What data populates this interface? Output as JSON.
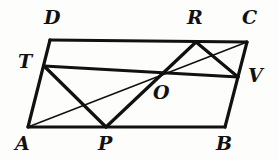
{
  "figure": {
    "background_color": "#fdfdfb",
    "stroke_color": "#111111",
    "thick_stroke_width": 3.2,
    "thin_stroke_width": 1.5,
    "width": 278,
    "height": 161
  },
  "points": {
    "D": {
      "label": "D",
      "x": 50,
      "y": 40,
      "label_x": 44,
      "label_y": 8
    },
    "C": {
      "label": "C",
      "x": 247,
      "y": 42,
      "label_x": 242,
      "label_y": 8
    },
    "A": {
      "label": "A",
      "x": 28,
      "y": 127,
      "label_x": 15,
      "label_y": 134
    },
    "B": {
      "label": "B",
      "x": 225,
      "y": 127,
      "label_x": 216,
      "label_y": 134
    },
    "T": {
      "label": "T",
      "x": 44,
      "y": 66,
      "label_x": 18,
      "label_y": 52
    },
    "R": {
      "label": "R",
      "x": 196,
      "y": 42,
      "label_x": 187,
      "label_y": 8
    },
    "V": {
      "label": "V",
      "x": 238,
      "y": 77,
      "label_x": 248,
      "label_y": 66
    },
    "P": {
      "label": "P",
      "x": 106,
      "y": 127,
      "label_x": 98,
      "label_y": 134
    },
    "O": {
      "label": "O",
      "x": 157,
      "y": 76,
      "label_x": 153,
      "label_y": 83
    }
  },
  "segments": [
    {
      "name": "side-DC",
      "from": "D",
      "to": "C",
      "weight": "thick"
    },
    {
      "name": "side-CB",
      "from": "C",
      "to": "B",
      "weight": "thick"
    },
    {
      "name": "side-BA",
      "from": "B",
      "to": "A",
      "weight": "thick"
    },
    {
      "name": "side-AD",
      "from": "A",
      "to": "D",
      "weight": "thick"
    },
    {
      "name": "segment-TV",
      "from": "T",
      "to": "V",
      "weight": "thick"
    },
    {
      "name": "segment-TP",
      "from": "T",
      "to": "P",
      "weight": "thick"
    },
    {
      "name": "segment-PR",
      "from": "P",
      "to": "R",
      "weight": "thick"
    },
    {
      "name": "segment-RV",
      "from": "R",
      "to": "V",
      "weight": "thick"
    },
    {
      "name": "diagonal-AC",
      "from": "A",
      "to": "C",
      "weight": "thin"
    }
  ]
}
